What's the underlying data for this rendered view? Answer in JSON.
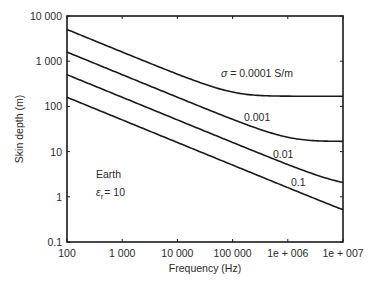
{
  "chart_data": {
    "type": "line",
    "title": "",
    "xlabel": "Frequency (Hz)",
    "ylabel": "Skin depth (m)",
    "xscale": "log",
    "yscale": "log",
    "xlim": [
      100,
      10000000
    ],
    "ylim": [
      0.1,
      10000
    ],
    "grid": false,
    "x_ticks": [
      100,
      1000,
      10000,
      100000,
      1000000,
      10000000
    ],
    "x_tick_labels": [
      "100",
      "1 000",
      "10 000",
      "100 000",
      "1e + 006",
      "1e + 007"
    ],
    "y_ticks": [
      0.1,
      1,
      10,
      100,
      1000,
      10000
    ],
    "y_tick_labels": [
      "0.1",
      "1",
      "10",
      "100",
      "1 000",
      "10 000"
    ],
    "x": [
      100,
      1000,
      10000,
      100000,
      1000000,
      10000000
    ],
    "series": [
      {
        "name": "σ = 0.0001 S/m",
        "sigma": 0.0001,
        "label": "σ = 0.0001 S/m",
        "values": [
          5030,
          1590,
          505,
          190,
          168,
          168
        ]
      },
      {
        "name": "0.001",
        "sigma": 0.001,
        "label": "0.001",
        "values": [
          1590,
          503,
          159,
          51,
          19,
          16.8
        ]
      },
      {
        "name": "0.01",
        "sigma": 0.01,
        "label": "0.01",
        "values": [
          503,
          159,
          50.3,
          15.9,
          5.1,
          1.9
        ]
      },
      {
        "name": "0.1",
        "sigma": 0.1,
        "label": "0.1",
        "values": [
          159,
          50.3,
          15.9,
          5.03,
          1.59,
          0.52
        ]
      }
    ],
    "annotations": [
      {
        "text": "Earth"
      },
      {
        "text": "εr = 10",
        "symbol": "ε",
        "subscript": "r",
        "value": "= 10"
      }
    ],
    "relative_permittivity": 10
  }
}
